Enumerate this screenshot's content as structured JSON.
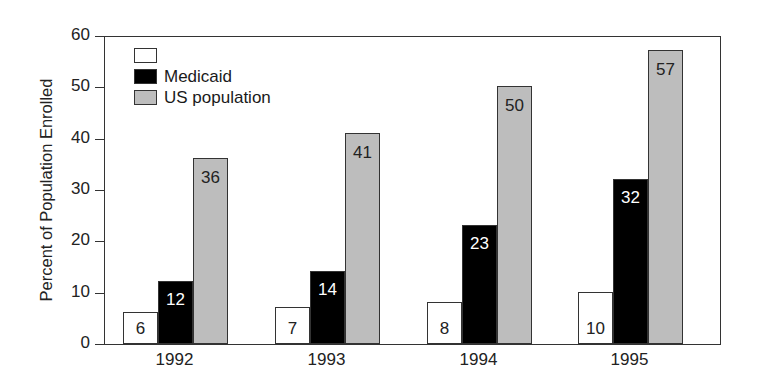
{
  "chart_data": {
    "type": "bar",
    "title": "",
    "xlabel": "",
    "ylabel": "Percent of Population Enrolled",
    "ylim": [
      0,
      60
    ],
    "yticks": [
      0,
      10,
      20,
      30,
      40,
      50,
      60
    ],
    "grid": false,
    "legend_position": "upper-left (inside)",
    "categories": [
      "1992",
      "1993",
      "1994",
      "1995"
    ],
    "series": [
      {
        "name": "",
        "color": "#ffffff",
        "values": [
          6,
          7,
          8,
          10
        ]
      },
      {
        "name": "Medicaid",
        "color": "#000000",
        "values": [
          12,
          14,
          23,
          32
        ]
      },
      {
        "name": "US population",
        "color": "#bdbdbd",
        "values": [
          36,
          41,
          50,
          57
        ]
      }
    ]
  },
  "labels": {
    "y": [
      "0",
      "10",
      "20",
      "30",
      "40",
      "50",
      "60"
    ],
    "x": [
      "1992",
      "1993",
      "1994",
      "1995"
    ],
    "bars": [
      [
        "6",
        "12",
        "36"
      ],
      [
        "7",
        "14",
        "41"
      ],
      [
        "8",
        "23",
        "50"
      ],
      [
        "10",
        "32",
        "57"
      ]
    ],
    "legend": [
      "",
      "Medicaid",
      "US population"
    ]
  }
}
